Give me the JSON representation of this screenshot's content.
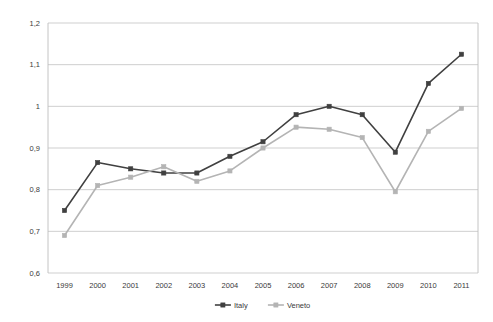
{
  "chart_data": {
    "type": "line",
    "title": "",
    "subtitle": "",
    "xlabel": "",
    "ylabel": "",
    "categories": [
      "1999",
      "2000",
      "2001",
      "2002",
      "2003",
      "2004",
      "2005",
      "2006",
      "2007",
      "2008",
      "2009",
      "2010",
      "2011"
    ],
    "x_tick_labels": [
      "1999",
      "2000",
      "2001",
      "2002",
      "2003",
      "2004",
      "2005",
      "2006",
      "2007",
      "2008",
      "2009",
      "2010",
      "2011"
    ],
    "y_tick_labels": [
      "0,6",
      "0,7",
      "0,8",
      "0,9",
      "1",
      "1,1",
      "1,2"
    ],
    "y_tick_values": [
      0.6,
      0.7,
      0.8,
      0.9,
      1.0,
      1.1,
      1.2
    ],
    "ylim": [
      0.6,
      1.2
    ],
    "grid": true,
    "legend_position": "bottom",
    "decimal_separator": ",",
    "series": [
      {
        "name": "Italy",
        "color": "#404040",
        "marker": "square",
        "values": [
          0.75,
          0.865,
          0.85,
          0.84,
          0.84,
          0.88,
          0.915,
          0.98,
          1.0,
          0.98,
          0.89,
          1.055,
          1.125
        ]
      },
      {
        "name": "Veneto",
        "color": "#b4b4b4",
        "marker": "square",
        "values": [
          0.69,
          0.81,
          0.83,
          0.855,
          0.82,
          0.845,
          0.9,
          0.95,
          0.945,
          0.925,
          0.795,
          0.94,
          0.995
        ]
      }
    ]
  },
  "legend": {
    "items": [
      {
        "label": "Italy",
        "color": "#404040"
      },
      {
        "label": "Veneto",
        "color": "#b4b4b4"
      }
    ]
  },
  "colors": {
    "italy": "#404040",
    "veneto": "#b4b4b4",
    "gridline": "#c3c3c3",
    "border": "#bdbdbd",
    "text": "#3a3a3a",
    "background": "#ffffff"
  }
}
